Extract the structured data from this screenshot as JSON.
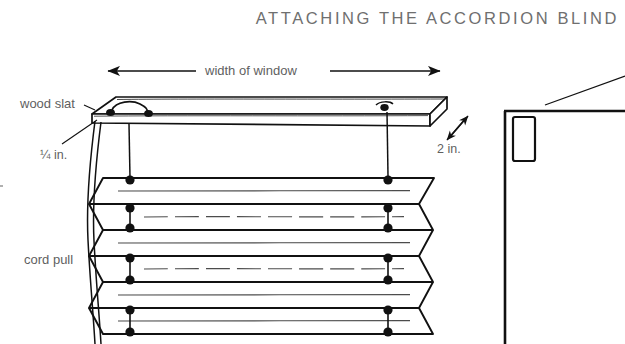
{
  "page": {
    "background_color": "#ffffff",
    "ink_color": "#111111",
    "text_color": "#5f6163",
    "title_color": "#6f6f6f",
    "width": 625,
    "height": 344
  },
  "header": {
    "title": "ATTACHING THE ACCORDION BLIND"
  },
  "figure": {
    "kind": "line-drawing",
    "labels": {
      "wood_slat": "wood slat",
      "slat_thickness": "¼ in.",
      "cord_pull": "cord pull",
      "width_of_window": "width of window",
      "slat_depth": "2 in."
    },
    "parts": {
      "wood_slat_name": "wood-slat",
      "screw_eye_name": "screw-eye",
      "cord_name": "lift-cord",
      "pleat_name": "accordion-pleat",
      "cord_pull_name": "cord-pull",
      "window_frame_name": "window-frame-corner",
      "mounting_block_name": "mounting-block"
    },
    "dimensions": {
      "width_arrow": "double-headed horizontal arrow spanning the slat",
      "depth_arrow": "double-headed diagonal arrow at the slat end"
    }
  }
}
